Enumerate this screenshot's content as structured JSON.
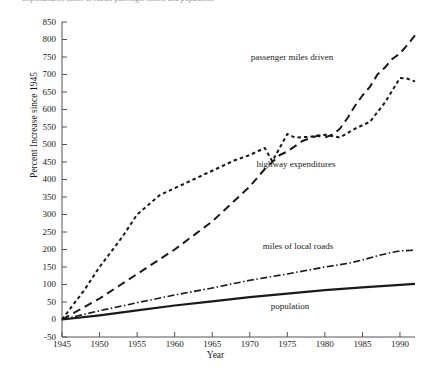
{
  "caption_clipped": "Expenditures, miles of roads, passenger miles, and population",
  "axis": {
    "ylabel": "Percent Increase since 1945",
    "xlabel": "Year",
    "yticks": [
      850,
      800,
      750,
      700,
      650,
      600,
      550,
      500,
      450,
      400,
      350,
      300,
      250,
      200,
      150,
      100,
      50,
      0,
      -50
    ],
    "xticks": [
      1945,
      1950,
      1955,
      1960,
      1965,
      1970,
      1975,
      1980,
      1985,
      1990
    ]
  },
  "annotations": [
    {
      "text": "passenger miles driven",
      "x": 292,
      "y": 57
    },
    {
      "text": "highway expenditures",
      "x": 296,
      "y": 164
    },
    {
      "text": "miles of local roads",
      "x": 298,
      "y": 246
    },
    {
      "text": "population",
      "x": 290,
      "y": 306
    }
  ],
  "colors": {
    "ink": "#1a1a1a",
    "axis": "#555555",
    "background": "#ffffff"
  },
  "chart_data": {
    "type": "line",
    "title": "",
    "xlabel": "Year",
    "ylabel": "Percent Increase since 1945",
    "xlim": [
      1945,
      1992
    ],
    "ylim": [
      -50,
      850
    ],
    "grid": false,
    "legend": "annotations-inline",
    "series": [
      {
        "name": "passenger miles driven",
        "style": "long-dash",
        "x": [
          1945,
          1950,
          1955,
          1960,
          1965,
          1970,
          1972,
          1974,
          1975,
          1977,
          1979,
          1980,
          1981,
          1982,
          1983,
          1984,
          1985,
          1986,
          1987,
          1988,
          1989,
          1990,
          1991,
          1992
        ],
        "values": [
          0,
          60,
          130,
          200,
          280,
          380,
          430,
          470,
          480,
          510,
          525,
          520,
          528,
          545,
          575,
          610,
          640,
          665,
          700,
          720,
          745,
          760,
          785,
          812
        ]
      },
      {
        "name": "highway expenditures",
        "style": "short-dash",
        "x": [
          1945,
          1948,
          1950,
          1953,
          1955,
          1958,
          1960,
          1963,
          1965,
          1968,
          1970,
          1972,
          1973,
          1975,
          1976,
          1978,
          1980,
          1982,
          1984,
          1986,
          1988,
          1990,
          1991,
          1992
        ],
        "values": [
          0,
          85,
          150,
          235,
          300,
          355,
          375,
          405,
          425,
          455,
          470,
          490,
          452,
          530,
          520,
          522,
          528,
          520,
          545,
          565,
          620,
          690,
          688,
          680
        ]
      },
      {
        "name": "miles of local roads",
        "style": "dash-dot",
        "x": [
          1945,
          1950,
          1955,
          1960,
          1965,
          1970,
          1975,
          1980,
          1983,
          1985,
          1987,
          1989,
          1990,
          1992
        ],
        "values": [
          0,
          25,
          48,
          70,
          90,
          112,
          130,
          150,
          160,
          170,
          182,
          192,
          196,
          198
        ]
      },
      {
        "name": "population",
        "style": "solid",
        "x": [
          1945,
          1950,
          1955,
          1960,
          1965,
          1970,
          1975,
          1980,
          1985,
          1990,
          1992
        ],
        "values": [
          0,
          12,
          26,
          40,
          52,
          64,
          74,
          84,
          92,
          99,
          102
        ]
      }
    ]
  }
}
